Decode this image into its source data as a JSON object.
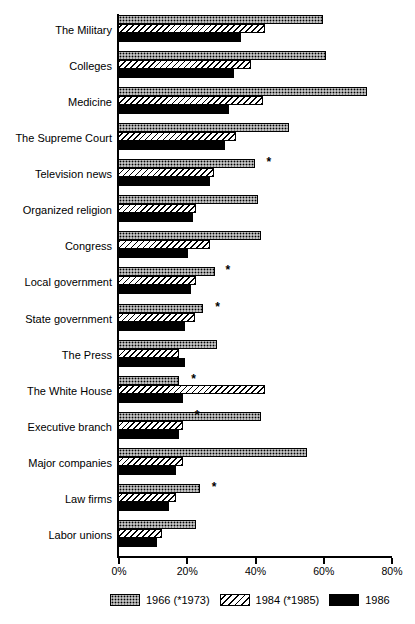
{
  "chart_data": {
    "type": "bar",
    "orientation": "horizontal",
    "title": "",
    "xlabel": "",
    "ylabel": "",
    "xlim": [
      0,
      80
    ],
    "xticks": [
      0,
      20,
      40,
      60,
      80
    ],
    "xtick_labels": [
      "0%",
      "20%",
      "40%",
      "60%",
      "80%"
    ],
    "grid": false,
    "legend_position": "bottom",
    "categories": [
      "The Military",
      "Colleges",
      "Medicine",
      "The Supreme Court",
      "Television news",
      "Organized religion",
      "Congress",
      "Local government",
      "State government",
      "The Press",
      "The White House",
      "Executive branch",
      "Major companies",
      "Law firms",
      "Labor unions"
    ],
    "series": [
      {
        "name": "1966 (*1973)",
        "pattern": "dotted",
        "values": [
          60,
          61,
          73,
          50,
          40,
          41,
          42,
          28.5,
          25,
          29,
          18,
          42,
          55.5,
          24,
          23
        ]
      },
      {
        "name": "1984 (*1985)",
        "pattern": "hatched",
        "values": [
          43,
          39,
          42.5,
          34.5,
          28,
          23,
          27,
          23,
          22.5,
          18,
          43,
          19,
          19,
          17,
          13
        ]
      },
      {
        "name": "1986",
        "pattern": "solid-black",
        "values": [
          36,
          34,
          32.5,
          31.5,
          27,
          22,
          20.5,
          21.5,
          19.5,
          19.5,
          19,
          18,
          17,
          15,
          11.5
        ]
      }
    ],
    "annotations": [
      {
        "category": "Television news",
        "marker": "*",
        "x": 43.5
      },
      {
        "category": "Local government",
        "marker": "*",
        "x": 31.5
      },
      {
        "category": "State government",
        "marker": "*",
        "x": 28.5
      },
      {
        "category": "The White House",
        "marker": "*",
        "x": 21.5
      },
      {
        "category": "Executive branch",
        "marker": "*",
        "x": 22.5
      },
      {
        "category": "Law firms",
        "marker": "*",
        "x": 27.5
      }
    ]
  },
  "legend": {
    "items": [
      {
        "label": "1966 (*1973)",
        "swatch": "sw1966"
      },
      {
        "label": "1984 (*1985)",
        "swatch": "sw1984"
      },
      {
        "label": "1986",
        "swatch": "sw1986"
      }
    ]
  },
  "colors": {
    "ink": "#000000",
    "paper": "#ffffff"
  }
}
